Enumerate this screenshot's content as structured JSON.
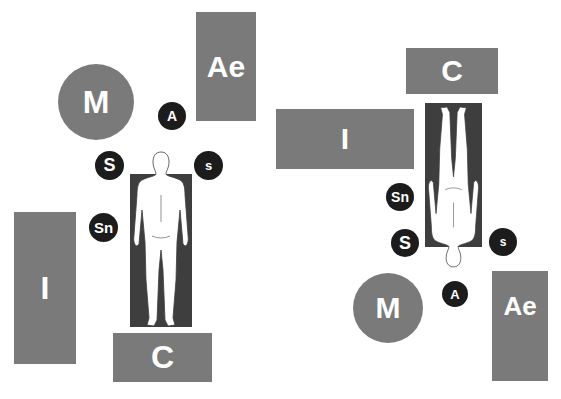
{
  "diagram": {
    "colors": {
      "box": "#7a7a7a",
      "dot": "#1c1c1c",
      "table": "#3e3e3e",
      "label": "#ffffff"
    },
    "left_layout": {
      "Ae": "Ae",
      "M": "M",
      "A": "A",
      "S_main": "S",
      "S_small": "s",
      "Sn": "Sn",
      "I": "I",
      "C": "C"
    },
    "right_layout": {
      "C": "C",
      "I": "I",
      "Sn": "Sn",
      "S_main": "S",
      "S_small": "s",
      "M": "M",
      "A": "A",
      "Ae": "Ae"
    }
  }
}
